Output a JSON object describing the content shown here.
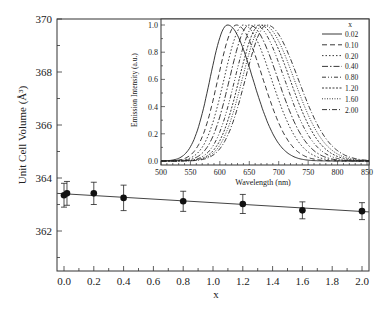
{
  "chart_data": [
    {
      "type": "scatter",
      "title": "",
      "xlabel": "x",
      "ylabel": "Unit Cell Volume (Å³)",
      "xlim": [
        -0.05,
        2.07
      ],
      "ylim": [
        360.5,
        370
      ],
      "xticks": [
        "0.0",
        "0.2",
        "0.4",
        "0.6",
        "0.8",
        "1.0",
        "1.2",
        "1.4",
        "1.6",
        "1.8",
        "2.0"
      ],
      "yticks": [
        "362",
        "364",
        "366",
        "368",
        "370"
      ],
      "grid": false,
      "series": [
        {
          "name": "Unit cell volume",
          "marker": "filled-circle",
          "x": [
            0.0,
            0.02,
            0.2,
            0.4,
            0.8,
            1.2,
            1.6,
            2.0
          ],
          "y": [
            363.35,
            363.42,
            363.42,
            363.25,
            363.12,
            363.02,
            362.78,
            362.75
          ],
          "yerr": [
            0.45,
            0.45,
            0.42,
            0.48,
            0.38,
            0.36,
            0.32,
            0.32
          ]
        },
        {
          "name": "Linear fit",
          "type": "line",
          "x": [
            -0.05,
            2.07
          ],
          "y": [
            363.42,
            362.72
          ]
        }
      ]
    },
    {
      "type": "line",
      "title": "",
      "xlabel": "Wavelength (nm)",
      "ylabel": "Emission Intensity (a.u.)",
      "xlim": [
        500,
        850
      ],
      "ylim": [
        -0.02,
        1.02
      ],
      "xticks": [
        "500",
        "550",
        "600",
        "650",
        "700",
        "750",
        "800",
        "850"
      ],
      "yticks": [
        "0.0",
        "0.2",
        "0.4",
        "0.6",
        "0.8",
        "1.0"
      ],
      "legend_title": "x",
      "legend_position": "upper right",
      "series": [
        {
          "name": "0.02",
          "peak": 613,
          "fwhm": 78,
          "dash": ""
        },
        {
          "name": "0.10",
          "peak": 628,
          "fwhm": 82,
          "dash": "5,3"
        },
        {
          "name": "0.20",
          "peak": 640,
          "fwhm": 86,
          "dash": "1.5,2"
        },
        {
          "name": "0.40",
          "peak": 650,
          "fwhm": 88,
          "dash": "6,2,1.5,2"
        },
        {
          "name": "0.80",
          "peak": 660,
          "fwhm": 90,
          "dash": "4,2,1,2,1,2"
        },
        {
          "name": "1.20",
          "peak": 668,
          "fwhm": 92,
          "dash": "2,1.5"
        },
        {
          "name": "1.60",
          "peak": 674,
          "fwhm": 94,
          "dash": "1,1.5"
        },
        {
          "name": "2.00",
          "peak": 680,
          "fwhm": 96,
          "dash": "5,2,1,2"
        }
      ]
    }
  ]
}
